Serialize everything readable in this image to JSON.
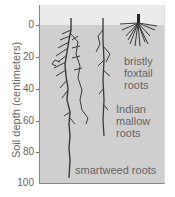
{
  "axis": {
    "ylabel": "Soil depth (centimeters)",
    "ticks": [
      "0",
      "20",
      "40",
      "60",
      "80",
      "100"
    ]
  },
  "labels": {
    "foxtail": [
      "bristly",
      "foxtail",
      "roots"
    ],
    "mallow": [
      "Indian",
      "mallow",
      "roots"
    ],
    "smartweed": "smartweed roots"
  },
  "colors": {
    "soil": "#cfcfcf",
    "surface": "#ebebeb",
    "root": "#3a3a3a"
  }
}
